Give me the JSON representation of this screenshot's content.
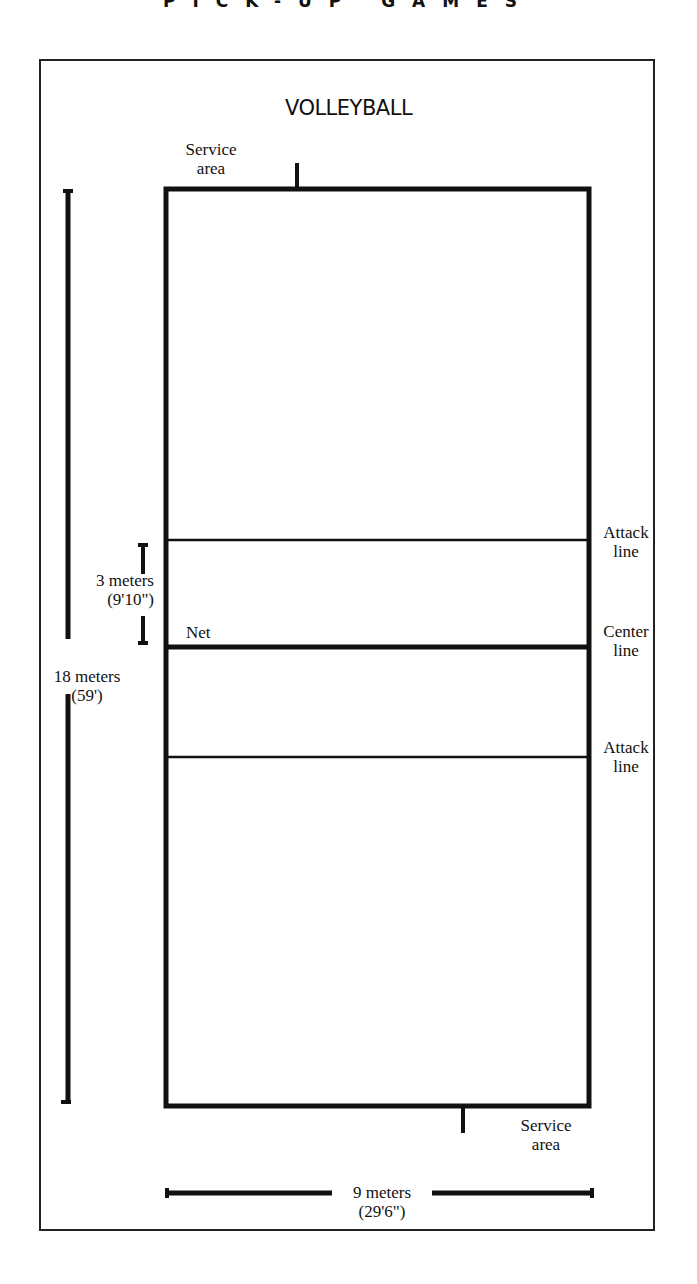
{
  "header": {
    "running_head": "PICK-UP GAMES"
  },
  "diagram": {
    "title": "VOLLEYBALL",
    "labels": {
      "service_area_top": [
        "Service",
        "area"
      ],
      "service_area_bottom": [
        "Service",
        "area"
      ],
      "attack_line_top": [
        "Attack",
        "line"
      ],
      "center_line": [
        "Center",
        "line"
      ],
      "attack_line_bottom": [
        "Attack",
        "line"
      ],
      "net": "Net"
    },
    "dimensions": {
      "length": {
        "metric": "18 meters",
        "imperial": "(59')"
      },
      "attack_zone": {
        "metric": "3 meters",
        "imperial": "(9'10\")"
      },
      "width": {
        "metric": "9 meters",
        "imperial": "(29'6\")"
      }
    },
    "colors": {
      "ink": "#111111",
      "paper": "#ffffff"
    }
  }
}
